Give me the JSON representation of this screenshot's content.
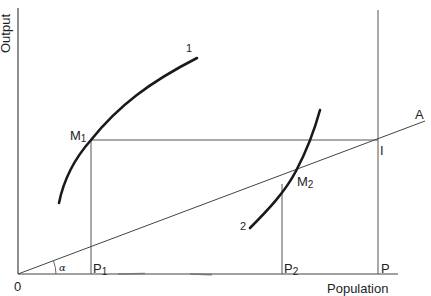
{
  "diagram": {
    "axes": {
      "x_label": "Population",
      "y_label": "Output",
      "origin_label": "0"
    },
    "points": {
      "M1": {
        "label": "M",
        "sub": "1"
      },
      "M2": {
        "label": "M",
        "sub": "2"
      },
      "I": {
        "label": "I"
      },
      "A": {
        "label": "A"
      },
      "P1": {
        "label": "P",
        "sub": "1"
      },
      "P2": {
        "label": "P",
        "sub": "2"
      },
      "P": {
        "label": "P"
      }
    },
    "curves": {
      "curve1": {
        "label": "1"
      },
      "curve2": {
        "label": "2"
      }
    },
    "angle": {
      "label": "α"
    },
    "colors": {
      "stroke": "#2a2a2a",
      "thin": "#4a4a4a",
      "background": "#ffffff"
    }
  }
}
